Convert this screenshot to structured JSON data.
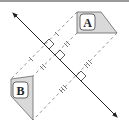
{
  "diagram": {
    "type": "reflection",
    "shapes": [
      {
        "label": "A",
        "fill": "#d9d9d9",
        "stroke": "#555555"
      },
      {
        "label": "B",
        "fill": "#d9d9d9",
        "stroke": "#555555"
      }
    ],
    "line_of_reflection": {
      "arrows": "both",
      "color": "#222222"
    },
    "connectors": [
      {
        "style": "dashed",
        "tick_marks": 1,
        "right_angle": true
      },
      {
        "style": "dashed",
        "tick_marks": 2,
        "right_angle": true
      },
      {
        "style": "dashed",
        "tick_marks": 3,
        "right_angle": true
      }
    ],
    "colors": {
      "shape_fill": "#d9d9d9",
      "line": "#222222",
      "dash": "#777777",
      "border": "#9a9a9a"
    }
  }
}
